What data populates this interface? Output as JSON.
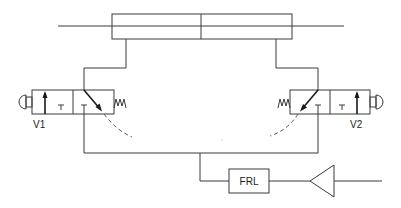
{
  "diagram": {
    "type": "pneumatic-circuit",
    "components": {
      "cylinder": {
        "name": "double-acting cylinder",
        "label": ""
      },
      "valve_left": {
        "label": "V1",
        "type": "3/2 push-button valve, spring return"
      },
      "valve_right": {
        "label": "V2",
        "type": "3/2 push-button valve, spring return"
      },
      "frl": {
        "label": "FRL"
      },
      "supply": {
        "name": "air supply / compressor symbol"
      }
    },
    "colors": {
      "line": "#3a3a3a",
      "background": "#ffffff"
    }
  }
}
